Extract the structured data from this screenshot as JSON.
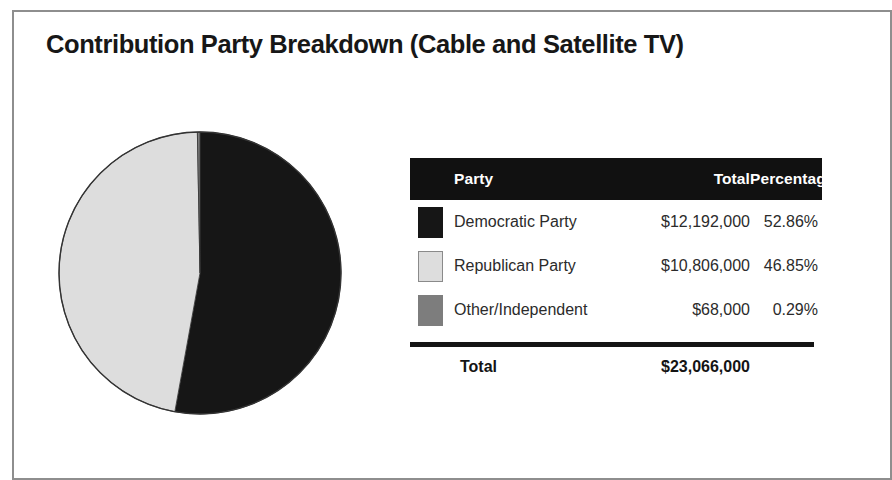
{
  "figure": {
    "title": "Contribution Party Breakdown (Cable and Satellite TV)"
  },
  "table": {
    "headers": {
      "party": "Party",
      "total": "Total",
      "percentage": "Percentage"
    },
    "rows": [
      {
        "swatch_name": "legend-swatch-democratic",
        "party": "Democratic Party",
        "total": "$12,192,000",
        "percentage": "52.86%"
      },
      {
        "swatch_name": "legend-swatch-republican",
        "party": "Republican Party",
        "total": "$10,806,000",
        "percentage": "46.85%"
      },
      {
        "swatch_name": "legend-swatch-other",
        "party": "Other/Independent",
        "total": "$68,000",
        "percentage": "0.29%"
      }
    ],
    "total_row": {
      "label": "Total",
      "value": "$23,066,000"
    }
  },
  "colors": {
    "democratic": "#161616",
    "republican": "#dddddd",
    "other": "#7d7d7d",
    "pie_outline": "#333333",
    "header_background": "#111111",
    "header_text": "#ffffff",
    "frame": "#8e8e8e",
    "text": "#2b2b2b"
  },
  "chart_data": {
    "type": "pie",
    "title": "Contribution Party Breakdown (Cable and Satellite TV)",
    "categories": [
      "Democratic Party",
      "Republican Party",
      "Other/Independent"
    ],
    "values": [
      12192000,
      10806000,
      68000
    ],
    "percentages": [
      52.86,
      46.85,
      0.29
    ],
    "value_labels": [
      "$12,192,000",
      "$10,806,000",
      "$68,000"
    ],
    "percent_labels": [
      "52.86%",
      "46.85%",
      "0.29%"
    ],
    "colors": [
      "#161616",
      "#dddddd",
      "#7d7d7d"
    ],
    "total": 23066000,
    "total_label": "$23,066,000",
    "start_angle_deg": 0,
    "direction": "clockwise",
    "legend_position": "right-table",
    "grid": false,
    "xlabel": "",
    "ylabel": ""
  }
}
